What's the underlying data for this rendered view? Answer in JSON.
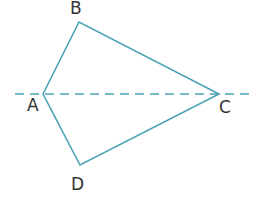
{
  "diagram": {
    "type": "kite",
    "colors": {
      "stroke": "#4aa3b5",
      "label": "#333333"
    },
    "vertices": [
      {
        "name": "A",
        "label": "A",
        "x": 43,
        "y": 94,
        "lx": 27,
        "ly": 111
      },
      {
        "name": "B",
        "label": "B",
        "x": 79,
        "y": 22,
        "lx": 70,
        "ly": 14
      },
      {
        "name": "C",
        "label": "C",
        "x": 219,
        "y": 94,
        "lx": 219,
        "ly": 113
      },
      {
        "name": "D",
        "label": "D",
        "x": 80,
        "y": 165,
        "lx": 71,
        "ly": 190
      }
    ],
    "edges": [
      "AB",
      "BC",
      "CD",
      "DA"
    ],
    "axis_of_symmetry": {
      "through": "AC",
      "style": "dashed",
      "x1": 15,
      "x2": 250,
      "y": 94
    }
  }
}
